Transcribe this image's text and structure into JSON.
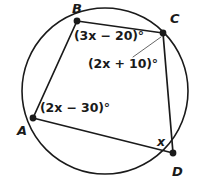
{
  "figure": {
    "shape_type": "circle-with-inscribed-quadrilateral",
    "stroke_color": "#1a1a1a",
    "fill_color": "#ffffff",
    "circle": {
      "cx": 105,
      "cy": 91,
      "r": 83
    },
    "vertices": [
      {
        "id": "A",
        "label": "A",
        "x": 33,
        "y": 118
      },
      {
        "id": "B",
        "label": "B",
        "x": 77,
        "y": 21
      },
      {
        "id": "C",
        "label": "C",
        "x": 163,
        "y": 33
      },
      {
        "id": "D",
        "label": "D",
        "x": 173,
        "y": 153
      }
    ],
    "sides": [
      {
        "from": "A",
        "to": "B"
      },
      {
        "from": "B",
        "to": "C"
      },
      {
        "from": "C",
        "to": "D"
      },
      {
        "from": "D",
        "to": "A"
      }
    ],
    "angle_labels": [
      {
        "id": "angle-b",
        "at_vertex": "B",
        "text": "(3x − 20)°"
      },
      {
        "id": "angle-c",
        "at_vertex": "C",
        "text": "(2x + 10)°"
      },
      {
        "id": "angle-a",
        "at_vertex": "A",
        "text": "(2x − 30)°"
      },
      {
        "id": "angle-d",
        "at_vertex": "D",
        "text": "x"
      }
    ],
    "leader_line": {
      "from_x": 133,
      "from_y": 57,
      "to_x": 161,
      "to_y": 37
    }
  }
}
